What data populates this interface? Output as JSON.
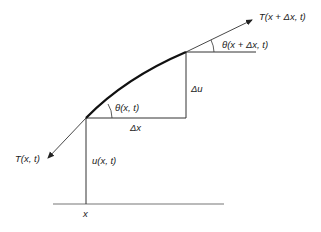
{
  "diagram": {
    "labels": {
      "tension_upper": "T(x + Δx, t)",
      "angle_upper": "θ(x + Δx, t)",
      "angle_lower": "θ(x, t)",
      "delta_u": "Δu",
      "delta_x": "Δx",
      "tension_lower": "T(x, t)",
      "displacement": "u(x, t)",
      "position": "x"
    },
    "colors": {
      "curve": "#111111",
      "lines": "#333333",
      "baseline": "#777777"
    }
  }
}
